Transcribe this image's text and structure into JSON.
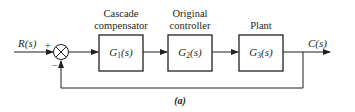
{
  "diagram": {
    "caption": "(a)",
    "input": {
      "label": "R(s)"
    },
    "output": {
      "label": "C(s)"
    },
    "summing_junction": {
      "plus_sign": "+",
      "minus_sign": "−"
    },
    "blocks": [
      {
        "title_line1": "Cascade",
        "title_line2": "compensator",
        "symbol": "G",
        "subscript": "1",
        "arg": "(s)"
      },
      {
        "title_line1": "Original",
        "title_line2": "controller",
        "symbol": "G",
        "subscript": "2",
        "arg": "(s)"
      },
      {
        "title_line1": "",
        "title_line2": "Plant",
        "symbol": "G",
        "subscript": "3",
        "arg": "(s)"
      }
    ],
    "colors": {
      "stroke": "#231f20",
      "background": "#ffffff"
    }
  }
}
